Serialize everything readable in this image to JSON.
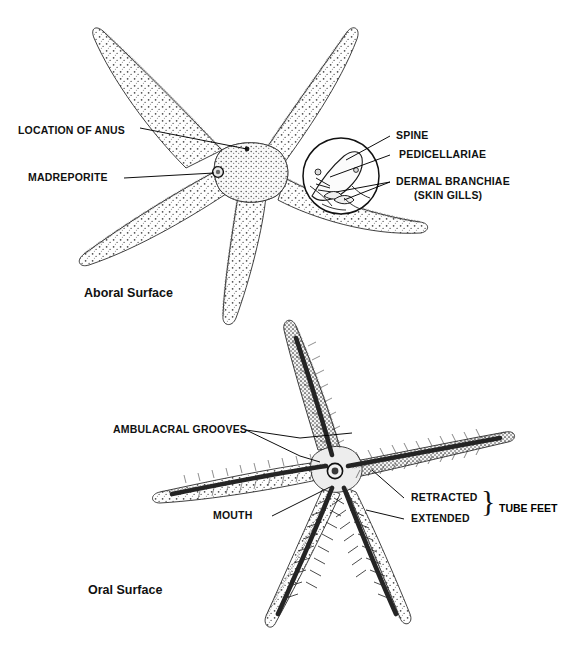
{
  "figure": {
    "panels": [
      {
        "id": "aboral",
        "caption": "Aboral Surface",
        "labels": [
          {
            "key": "anus",
            "text": "LOCATION OF ANUS",
            "name": "label-location-of-anus"
          },
          {
            "key": "madreporite",
            "text": "MADREPORITE",
            "name": "label-madreporite"
          },
          {
            "key": "spine",
            "text": "SPINE",
            "name": "label-spine"
          },
          {
            "key": "pedicellariae",
            "text": "PEDICELLARIAE",
            "name": "label-pedicellariae"
          },
          {
            "key": "branchiae",
            "text": "DERMAL BRANCHIAE",
            "name": "label-dermal-branchiae"
          },
          {
            "key": "branchiae_sub",
            "text": "(SKIN GILLS)",
            "name": "label-skin-gills"
          }
        ]
      },
      {
        "id": "oral",
        "caption": "Oral Surface",
        "labels": [
          {
            "key": "grooves",
            "text": "AMBULACRAL GROOVES",
            "name": "label-ambulacral-grooves"
          },
          {
            "key": "mouth",
            "text": "MOUTH",
            "name": "label-mouth"
          },
          {
            "key": "retracted",
            "text": "RETRACTED",
            "name": "label-retracted"
          },
          {
            "key": "extended",
            "text": "EXTENDED",
            "name": "label-extended"
          },
          {
            "key": "tube_feet",
            "text": "TUBE FEET",
            "name": "label-tube-feet"
          },
          {
            "key": "brace",
            "text": "}",
            "name": "brace-glyph"
          }
        ]
      }
    ]
  },
  "colors": {
    "background": "#ffffff",
    "ink": "#111111",
    "leader": "#000000",
    "stipple_light": "#9a9a9a",
    "stipple_mid": "#6b6b6b",
    "stipple_dark": "#2e2e2e",
    "body_fill": "#fdfdfd",
    "groove_dark": "#2b2b2b"
  }
}
